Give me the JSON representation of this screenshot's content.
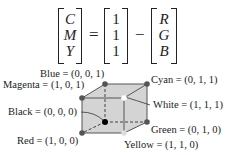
{
  "equation": {
    "lhs": [
      "C",
      "M",
      "Y"
    ],
    "equals": "=",
    "ones": [
      "1",
      "1",
      "1"
    ],
    "minus": "−",
    "rhs": [
      "R",
      "G",
      "B"
    ]
  },
  "cube": {
    "vertices": {
      "blue": "Blue = (0, 0, 1)",
      "cyan": "Cyan = (0, 1, 1)",
      "magenta": "Magenta = (1, 0, 1)",
      "white": "White = (1, 1, 1)",
      "black": "Black = (0, 0, 0)",
      "green": "Green = (0, 1, 0)",
      "red": "Red = (1, 0, 0)",
      "yellow": "Yellow = (1, 1, 0)"
    },
    "colors": {
      "face": "#d4d4d4",
      "edge": "#555555",
      "vertex": "#555555",
      "black_vertex": "#000000",
      "white_vertex": "#ffffff"
    }
  }
}
